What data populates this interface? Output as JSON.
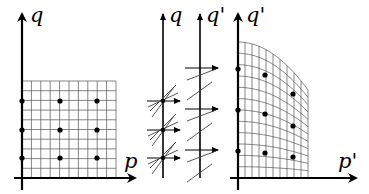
{
  "panels": [
    {
      "id": "original",
      "axis_labels": {
        "vertical": "q",
        "horizontal": "p"
      },
      "grid": {
        "x0": 22,
        "y0": 178,
        "x1": 116,
        "y1": 81,
        "cols": 10,
        "rows": 10
      },
      "dots": [
        [
          22,
          101
        ],
        [
          60,
          101
        ],
        [
          97,
          101
        ],
        [
          22,
          130
        ],
        [
          60,
          130
        ],
        [
          97,
          130
        ],
        [
          22,
          158
        ],
        [
          60,
          158
        ],
        [
          97,
          158
        ]
      ]
    },
    {
      "id": "shear-map",
      "axis_labels": {
        "left": "q",
        "right": "q'"
      },
      "left_points_y": [
        101,
        130,
        158
      ],
      "right_arrows_y": [
        68,
        109,
        150
      ]
    },
    {
      "id": "transformed",
      "axis_labels": {
        "vertical": "q'",
        "horizontal": "p'"
      },
      "dots": [
        [
          238,
          69
        ],
        [
          265,
          75
        ],
        [
          293,
          94
        ],
        [
          238,
          110
        ],
        [
          265,
          114
        ],
        [
          293,
          126
        ],
        [
          238,
          151
        ],
        [
          265,
          153
        ],
        [
          293,
          157
        ]
      ]
    }
  ],
  "colors": {
    "ink": "#000000",
    "grid": "#555555",
    "background": "#ffffff"
  }
}
